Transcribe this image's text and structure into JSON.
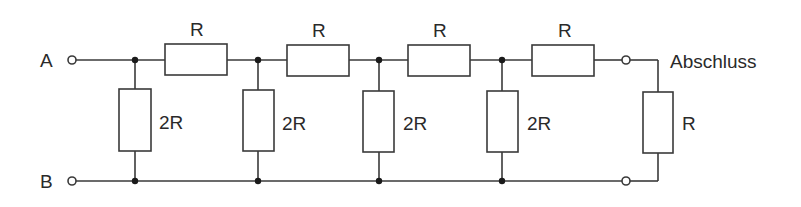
{
  "diagram": {
    "type": "R-2R ladder network",
    "terminals": {
      "input_top": "A",
      "input_bottom": "B",
      "termination_label": "Abschluss"
    },
    "series_resistors": [
      {
        "label": "R"
      },
      {
        "label": "R"
      },
      {
        "label": "R"
      },
      {
        "label": "R"
      }
    ],
    "shunt_resistors": [
      {
        "label": "2R"
      },
      {
        "label": "2R"
      },
      {
        "label": "2R"
      },
      {
        "label": "2R"
      }
    ],
    "termination_resistor": {
      "label": "R"
    },
    "colors": {
      "line": "#3a3a3a",
      "node": "#1a1a1a",
      "background": "#ffffff"
    }
  }
}
